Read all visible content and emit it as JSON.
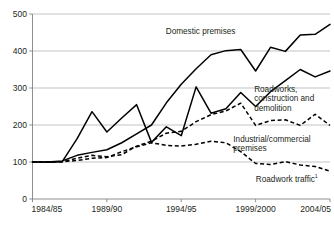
{
  "chart_data": {
    "type": "line",
    "title": "",
    "subtitle": "",
    "xlabel": "",
    "ylabel": "",
    "xlim": [
      0,
      20
    ],
    "ylim": [
      0,
      500
    ],
    "grid": true,
    "legend_position": "inline-annotations",
    "y_ticks": [
      "0",
      "100",
      "200",
      "300",
      "400",
      "500"
    ],
    "y_tick_values": [
      0,
      100,
      200,
      300,
      400,
      500
    ],
    "x_ticks": [
      "1984/85",
      "1989/90",
      "1994/95",
      "1999/2000",
      "2004/05"
    ],
    "x_tick_indices": [
      0,
      5,
      10,
      15,
      20
    ],
    "x": [
      "1984/85",
      "1985/86",
      "1986/87",
      "1987/88",
      "1988/89",
      "1989/90",
      "1990/91",
      "1991/92",
      "1992/93",
      "1993/94",
      "1994/95",
      "1995/96",
      "1996/97",
      "1997/98",
      "1998/99",
      "1999/2000",
      "2000/01",
      "2001/02",
      "2002/03",
      "2003/04",
      "2004/05"
    ],
    "series": [
      {
        "name": "Domestic premises",
        "style": "solid",
        "label_x_index": 11.3,
        "label_y_value": 447,
        "label_anchor": "middle",
        "values": [
          100,
          100,
          103,
          118,
          126,
          133,
          152,
          176,
          200,
          260,
          310,
          352,
          390,
          401,
          404,
          346,
          410,
          399,
          443,
          445,
          472
        ]
      },
      {
        "name": "Roadworks, construction and demolition",
        "style": "solid",
        "label_lines": [
          "Roadworks,",
          "construction and",
          "demolition"
        ],
        "label_x_index": 14.9,
        "label_y_value": 290,
        "label_anchor": "start",
        "values": [
          100,
          99,
          101,
          163,
          236,
          181,
          219,
          255,
          153,
          195,
          171,
          303,
          232,
          244,
          288,
          250,
          290,
          320,
          350,
          330,
          346
        ]
      },
      {
        "name": "Industrial/commercial premises",
        "style": "dashed",
        "label_lines": [
          "Industrial/commercial",
          "premises"
        ],
        "label_x_index": 13.5,
        "label_y_value": 155,
        "label_anchor": "start",
        "values": [
          100,
          100,
          101,
          110,
          118,
          114,
          120,
          143,
          156,
          178,
          183,
          209,
          228,
          238,
          259,
          199,
          212,
          214,
          199,
          229,
          199
        ]
      },
      {
        "name": "Roadwork traffic",
        "name_superscript": "1",
        "style": "dashed",
        "label_x_index": 17.1,
        "label_y_value": 47,
        "label_anchor": "middle",
        "values": [
          100,
          100,
          101,
          104,
          110,
          112,
          128,
          141,
          152,
          145,
          143,
          148,
          156,
          152,
          128,
          96,
          93,
          101,
          92,
          88,
          75
        ]
      }
    ]
  }
}
